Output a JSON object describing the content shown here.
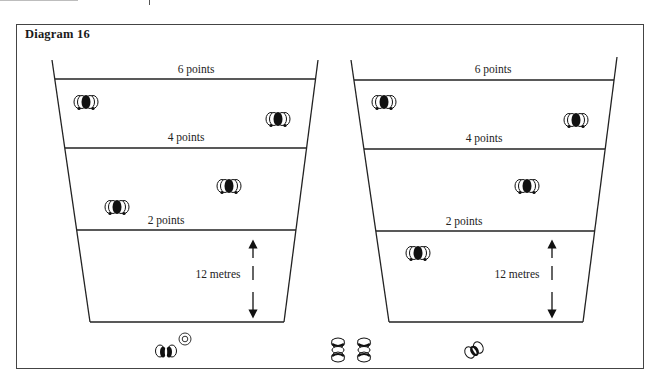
{
  "diagram": {
    "title": "Diagram 16",
    "colors": {
      "line": "#222222",
      "frame": "#444444",
      "text": "#1a1a1a"
    },
    "courts": [
      {
        "id": "left",
        "zones": [
          {
            "label": "6 points"
          },
          {
            "label": "4 points"
          },
          {
            "label": "2 points"
          }
        ],
        "distance_label": "12 metres",
        "players": [
          {
            "icon": "player-group-icon",
            "zone": "6 points",
            "position": "left"
          },
          {
            "icon": "player-group-icon",
            "zone": "6 points",
            "position": "right"
          },
          {
            "icon": "player-group-icon",
            "zone": "4 points",
            "position": "center-right"
          },
          {
            "icon": "player-group-icon",
            "zone": "4 points",
            "position": "left"
          }
        ]
      },
      {
        "id": "right",
        "zones": [
          {
            "label": "6 points"
          },
          {
            "label": "4 points"
          },
          {
            "label": "2 points"
          }
        ],
        "distance_label": "12 metres",
        "players": [
          {
            "icon": "player-group-icon",
            "zone": "6 points",
            "position": "left"
          },
          {
            "icon": "player-group-icon",
            "zone": "6 points",
            "position": "right"
          },
          {
            "icon": "player-group-icon",
            "zone": "4 points",
            "position": "center"
          },
          {
            "icon": "player-group-icon",
            "zone": "12 metres area",
            "position": "left"
          }
        ]
      }
    ],
    "bottom_icons": [
      {
        "icon": "shooter-with-ball-icon"
      },
      {
        "icon": "target-ball-icon"
      },
      {
        "icon": "waiting-players-icon"
      },
      {
        "icon": "waiting-players-icon"
      },
      {
        "icon": "shooter-icon"
      }
    ]
  }
}
